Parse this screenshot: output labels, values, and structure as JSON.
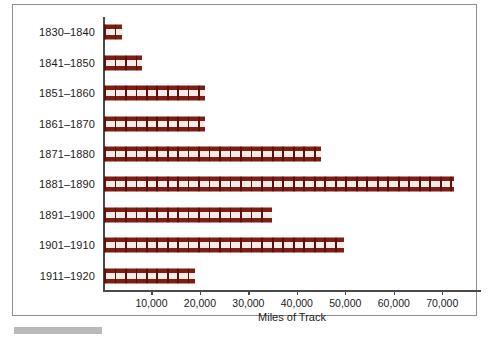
{
  "chart_data": {
    "type": "bar",
    "orientation": "horizontal",
    "title": "",
    "xlabel": "Miles of Track",
    "ylabel": "",
    "categories": [
      "1830–1840",
      "1841–1850",
      "1851–1860",
      "1861–1870",
      "1871–1880",
      "1881–1890",
      "1891–1900",
      "1901–1910",
      "1911–1920"
    ],
    "values": [
      3700,
      7800,
      20800,
      20800,
      44700,
      72200,
      34700,
      49500,
      18700
    ],
    "xlim": [
      0,
      78000
    ],
    "xticks": [
      10000,
      20000,
      30000,
      40000,
      50000,
      60000,
      70000
    ],
    "xtick_labels": [
      "10,000",
      "20,000",
      "30,000",
      "40,000",
      "50,000",
      "60,000",
      "70,000"
    ],
    "grid": false,
    "legend": null,
    "series": [
      {
        "name": "Miles of Track",
        "values": [
          3700,
          7800,
          20800,
          20800,
          44700,
          72200,
          34700,
          49500,
          18700
        ]
      }
    ],
    "bar_style": "railroad-track",
    "colors": {
      "rail": "#7e1d15",
      "tie": "#5c1109",
      "ballast": "#f4ece9",
      "axis": "#4a4a4a",
      "text": "#1c1c1c",
      "frame": "#8d8d8d",
      "footer_rule": "#b9b9b9"
    }
  }
}
